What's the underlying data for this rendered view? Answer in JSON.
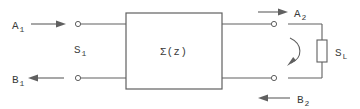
{
  "diagram": {
    "network_block": {
      "label_text": "Σ",
      "label_arg": "(z)",
      "full_label": "Σ(z)"
    },
    "ports": {
      "input": {
        "incident": {
          "base": "A",
          "sub": "1",
          "full": "A1",
          "arrow": "right-arrow-icon"
        },
        "reflected": {
          "base": "B",
          "sub": "1",
          "full": "B1",
          "arrow": "left-arrow-icon"
        },
        "scattering_label": {
          "base": "S",
          "sub": "1",
          "full": "S1"
        }
      },
      "output": {
        "incident": {
          "base": "A",
          "sub": "2",
          "full": "A2",
          "arrow": "right-arrow-icon"
        },
        "reflected": {
          "base": "B",
          "sub": "2",
          "full": "B2",
          "arrow": "left-arrow-icon"
        },
        "load_label": {
          "base": "S",
          "sub": "L",
          "full": "SL"
        }
      }
    },
    "load_element": {
      "name": "load-impedance",
      "reflection_arrow": "curved-arrow-icon"
    },
    "colors": {
      "line": "#606060",
      "text": "#3a3a3a",
      "background": "#ffffff"
    }
  }
}
